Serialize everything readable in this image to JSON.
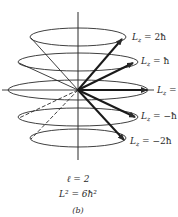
{
  "figure": {
    "panel_label": "(b)",
    "quantum_number": "ℓ = 2",
    "total_angular_momentum": "L² = 6ħ²",
    "colors": {
      "stroke": "#2a2a2a",
      "background": "#ffffff"
    }
  },
  "states": [
    {
      "m": 2,
      "label": "L",
      "sub": "z",
      "value": " = 2ħ"
    },
    {
      "m": 1,
      "label": "L",
      "sub": "z",
      "value": " = ħ"
    },
    {
      "m": 0,
      "label": "L",
      "sub": "z",
      "value": " ="
    },
    {
      "m": -1,
      "label": "L",
      "sub": "z",
      "value": " = −ħ"
    },
    {
      "m": -2,
      "label": "L",
      "sub": "z",
      "value": " = −2ħ"
    }
  ]
}
